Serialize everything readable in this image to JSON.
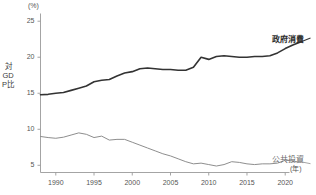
{
  "chart_data": {
    "type": "line",
    "title": "",
    "subtitle": "",
    "xlabel": "(年)",
    "ylabel": "対GDP比",
    "yunit": "(%)",
    "xlim": [
      1988,
      2022
    ],
    "ylim": [
      4,
      26
    ],
    "yticks": [
      5,
      10,
      15,
      20,
      25
    ],
    "ytick_labels": [
      "5",
      "10",
      "15",
      "20",
      "25"
    ],
    "xticks": [
      1990,
      1995,
      2000,
      2005,
      2010,
      2015,
      2020
    ],
    "xtick_labels": [
      "1990",
      "1995",
      "2000",
      "2005",
      "2010",
      "2015",
      "2020"
    ],
    "xticks_minor": [
      1990,
      1995,
      2000,
      2005,
      2010,
      2015,
      2020
    ],
    "grid": false,
    "legend_position": "right-inline",
    "x": [
      1988,
      1989,
      1990,
      1991,
      1992,
      1993,
      1994,
      1995,
      1996,
      1997,
      1998,
      1999,
      2000,
      2001,
      2002,
      2003,
      2004,
      2005,
      2006,
      2007,
      2008,
      2009,
      2010,
      2011,
      2012,
      2013,
      2014,
      2015,
      2016,
      2017,
      2018,
      2019,
      2020,
      2021,
      2022
    ],
    "series": [
      {
        "name": "政府消費",
        "color": "#333333",
        "width": 1.6,
        "label_anchor": {
          "x": 2022,
          "y": 22.1
        },
        "values": [
          14.8,
          14.85,
          15.0,
          15.1,
          15.4,
          15.7,
          16.0,
          16.6,
          16.8,
          16.9,
          17.4,
          17.8,
          18.0,
          18.4,
          18.5,
          18.4,
          18.3,
          18.3,
          18.2,
          18.2,
          18.6,
          20.0,
          19.7,
          20.1,
          20.2,
          20.1,
          20.0,
          20.0,
          20.1,
          20.1,
          20.2,
          20.6,
          21.2,
          21.7,
          22.1
        ]
      },
      {
        "name": "公共投資",
        "color": "#8e8e8e",
        "width": 1.0,
        "label_anchor": {
          "x": 2022,
          "y": 5.5
        },
        "values": [
          9.0,
          8.85,
          8.75,
          8.9,
          9.2,
          9.5,
          9.3,
          8.85,
          9.05,
          8.5,
          8.6,
          8.6,
          8.2,
          7.8,
          7.4,
          7.0,
          6.6,
          6.3,
          5.9,
          5.5,
          5.2,
          5.3,
          5.1,
          4.9,
          5.1,
          5.5,
          5.4,
          5.2,
          5.1,
          5.2,
          5.2,
          5.3,
          5.7,
          5.6,
          5.4
        ]
      }
    ]
  },
  "axis": {
    "y_title_chars": "対GDP比",
    "y_unit": "(%)",
    "x_unit": "(年)"
  },
  "legend": {
    "gov_label": "政府消費",
    "pub_label": "公共投資"
  }
}
